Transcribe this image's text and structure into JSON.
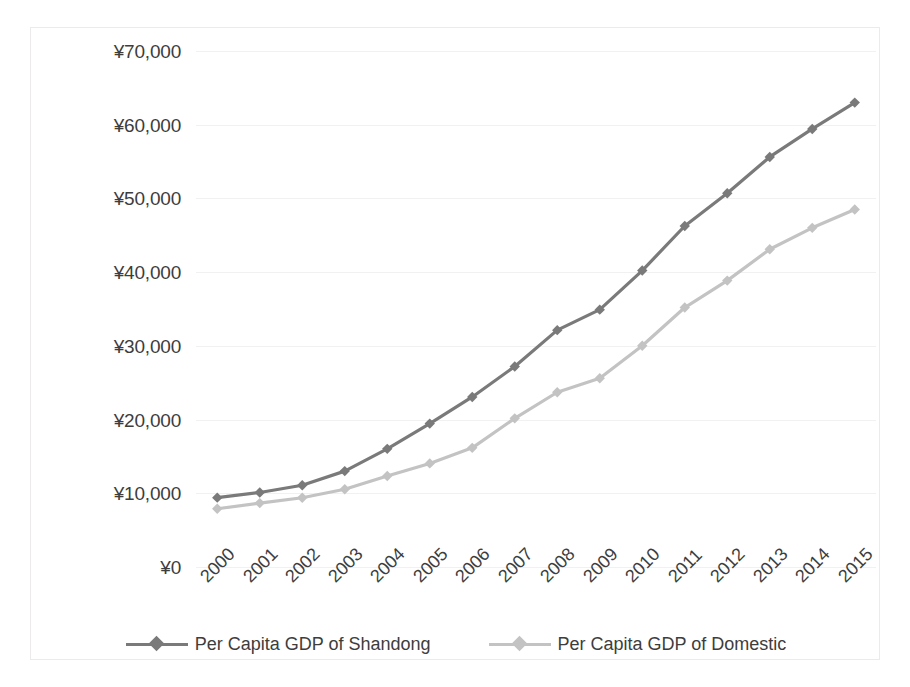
{
  "chart_data": {
    "type": "line",
    "title": "",
    "xlabel": "",
    "ylabel": "",
    "categories": [
      "2000",
      "2001",
      "2002",
      "2003",
      "2004",
      "2005",
      "2006",
      "2007",
      "2008",
      "2009",
      "2010",
      "2011",
      "2012",
      "2013",
      "2014",
      "2015"
    ],
    "ylim": [
      0,
      70000
    ],
    "y_ticks": [
      0,
      10000,
      20000,
      30000,
      40000,
      50000,
      60000,
      70000
    ],
    "y_tick_labels": [
      "¥0",
      "¥10,000",
      "¥20,000",
      "¥30,000",
      "¥40,000",
      "¥50,000",
      "¥60,000",
      "¥70,000"
    ],
    "grid": true,
    "legend_position": "bottom",
    "series": [
      {
        "name": "Per Capita GDP of Shandong",
        "color": "#7a7a7a",
        "marker": "diamond",
        "values": [
          9409,
          10105,
          11089,
          13009,
          16031,
          19453,
          23070,
          27200,
          32131,
          34911,
          40215,
          46257,
          50693,
          55629,
          59426,
          63000
        ]
      },
      {
        "name": "Per Capita GDP of Domestic",
        "color": "#c3c3c3",
        "marker": "diamond",
        "values": [
          7902,
          8671,
          9398,
          10542,
          12336,
          14053,
          16165,
          20169,
          23708,
          25608,
          30015,
          35198,
          38852,
          43100,
          46012,
          48500
        ]
      }
    ]
  },
  "legend": {
    "items": [
      {
        "label": "Per Capita GDP of Shandong",
        "color": "#7a7a7a"
      },
      {
        "label": "Per Capita GDP of Domestic",
        "color": "#c3c3c3"
      }
    ]
  }
}
